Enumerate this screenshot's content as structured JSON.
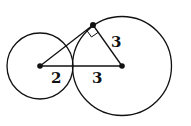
{
  "diagram": {
    "type": "geometry",
    "stroke_color": "#111111",
    "background": "#ffffff",
    "small_circle": {
      "cx": 40,
      "cy": 66,
      "r": 33
    },
    "large_circle": {
      "cx": 122,
      "cy": 66,
      "r": 49
    },
    "tangent_point": {
      "x": 93,
      "y": 25
    },
    "labels": {
      "small_radius": "2",
      "gap_segment": "3",
      "large_radius": "3"
    },
    "right_angle_marker": true
  }
}
